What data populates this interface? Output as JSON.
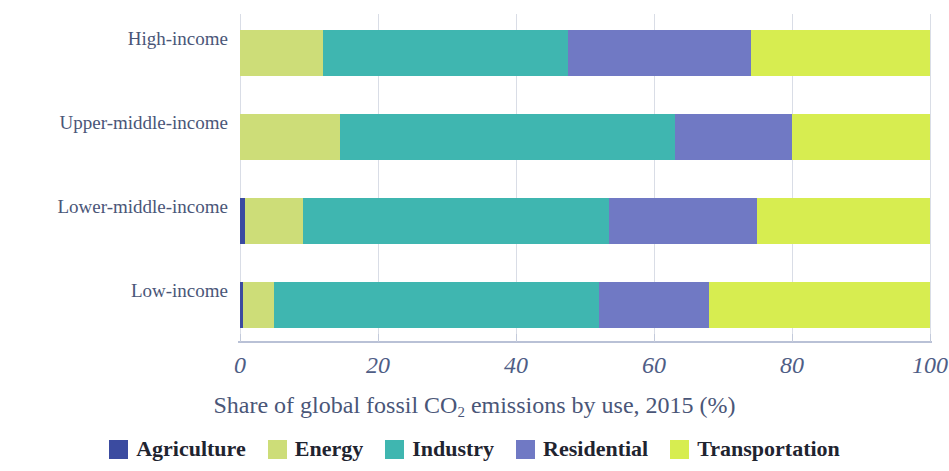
{
  "chart_data": {
    "type": "bar",
    "orientation": "horizontal",
    "stacked": true,
    "normalized": true,
    "title": "",
    "xlabel": "Share of global fossil CO2 emissions by use, 2015 (%)",
    "xlabel_parts": {
      "before_sub": "Share of global fossil CO",
      "sub": "2",
      "after_sub": " emissions by use, 2015 (%)"
    },
    "ylabel": "",
    "categories": [
      "High-income",
      "Upper-middle-income",
      "Lower-middle-income",
      "Low-income"
    ],
    "xlim": [
      0,
      100
    ],
    "xticks": [
      0,
      20,
      40,
      60,
      80,
      100
    ],
    "xtick_labels": [
      "0",
      "20",
      "40",
      "60",
      "80",
      "100"
    ],
    "grid": true,
    "grid_axis": "x",
    "legend_position": "bottom",
    "series": [
      {
        "name": "Agriculture",
        "color": "#3b4ba0",
        "values": [
          0.0,
          0.0,
          0.7,
          0.5
        ]
      },
      {
        "name": "Energy",
        "color": "#cddd78",
        "values": [
          12.0,
          14.5,
          8.5,
          4.5
        ]
      },
      {
        "name": "Industry",
        "color": "#3fb6b0",
        "values": [
          35.5,
          48.5,
          44.3,
          47.0
        ]
      },
      {
        "name": "Residential",
        "color": "#7079c4",
        "values": [
          26.5,
          17.0,
          21.5,
          16.0
        ]
      },
      {
        "name": "Transportation",
        "color": "#d7ed50",
        "values": [
          26.0,
          20.0,
          25.0,
          32.0
        ]
      }
    ]
  },
  "axis": {
    "tick_labels": [
      "0",
      "20",
      "40",
      "60",
      "80",
      "100"
    ]
  },
  "legend": {
    "items": [
      {
        "label": "Agriculture",
        "color": "#3b4ba0"
      },
      {
        "label": "Energy",
        "color": "#cddd78"
      },
      {
        "label": "Industry",
        "color": "#3fb6b0"
      },
      {
        "label": "Residential",
        "color": "#7079c4"
      },
      {
        "label": "Transportation",
        "color": "#d7ed50"
      }
    ]
  },
  "colors": {
    "agriculture": "#3b4ba0",
    "energy": "#cddd78",
    "industry": "#3fb6b0",
    "residential": "#7079c4",
    "transportation": "#d7ed50",
    "axis_text": "#4a5678",
    "gridline": "#d9dde6",
    "baseline": "#b9c1d6",
    "background": "#ffffff"
  }
}
